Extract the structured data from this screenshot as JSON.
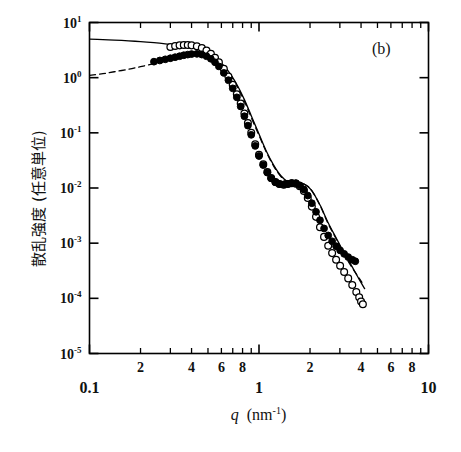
{
  "figure": {
    "panel_label": "(b)",
    "caption_fragment": ""
  },
  "chart_data": {
    "type": "scatter",
    "title": "",
    "xlabel": "q (nm-1)",
    "xlabel_symbol": "q",
    "xlabel_unit": "nm",
    "xlabel_unit_exp": "-1",
    "ylabel": "散乱強度 (任意単位)",
    "xscale": "log",
    "yscale": "log",
    "xlim": [
      0.1,
      10
    ],
    "ylim": [
      1e-05,
      10
    ],
    "grid": false,
    "legend": "none",
    "x_major_labels": [
      "0.1",
      "1",
      "10"
    ],
    "x_minor_labels": [
      "2",
      "4",
      "6",
      "8"
    ],
    "y_tick_labels": [
      "10^1",
      "10^0",
      "10^-1",
      "10^-2",
      "10^-3",
      "10^-4",
      "10^-5"
    ],
    "y_tick_mantissa": [
      "10",
      "10",
      "10",
      "10",
      "10",
      "10",
      "10"
    ],
    "y_tick_exponents": [
      "1",
      "0",
      "-1",
      "-2",
      "-3",
      "-4",
      "-5"
    ],
    "y_tick_values": [
      10,
      1,
      0.1,
      0.01,
      0.001,
      0.0001,
      1e-05
    ],
    "series": [
      {
        "name": "open-circles",
        "marker": "open-circle",
        "color": "#000000",
        "x": [
          0.3,
          0.32,
          0.34,
          0.36,
          0.38,
          0.4,
          0.43,
          0.46,
          0.49,
          0.52,
          0.55,
          0.58,
          0.62,
          0.66,
          0.7,
          0.74,
          0.78,
          0.82,
          0.86,
          0.9,
          0.95,
          1.0,
          1.06,
          1.12,
          1.18,
          1.25,
          1.32,
          1.4,
          1.48,
          1.56,
          1.65,
          1.74,
          1.84,
          1.94,
          2.05,
          2.17,
          2.29,
          2.42,
          2.56,
          2.7,
          2.85,
          3.01,
          3.18,
          3.36,
          3.55,
          3.75,
          3.9,
          4.0,
          4.1
        ],
        "y": [
          3.6,
          3.75,
          3.85,
          3.9,
          3.9,
          3.85,
          3.7,
          3.45,
          3.1,
          2.7,
          2.3,
          1.9,
          1.45,
          1.05,
          0.74,
          0.5,
          0.34,
          0.225,
          0.15,
          0.1,
          0.062,
          0.04,
          0.027,
          0.0195,
          0.0152,
          0.0128,
          0.0118,
          0.0115,
          0.0118,
          0.0122,
          0.012,
          0.0108,
          0.0088,
          0.0066,
          0.0046,
          0.003,
          0.00195,
          0.0013,
          0.0009,
          0.00066,
          0.0005,
          0.00039,
          0.0003,
          0.00023,
          0.000175,
          0.00013,
          0.000105,
          8.8e-05,
          7.8e-05
        ]
      },
      {
        "name": "filled-circles",
        "marker": "filled-circle",
        "color": "#000000",
        "x": [
          0.24,
          0.26,
          0.28,
          0.3,
          0.32,
          0.34,
          0.36,
          0.38,
          0.4,
          0.43,
          0.46,
          0.49,
          0.52,
          0.55,
          0.58,
          0.62,
          0.66,
          0.7,
          0.74,
          0.78,
          0.82,
          0.86,
          0.9,
          0.95,
          1.0,
          1.06,
          1.12,
          1.18,
          1.25,
          1.32,
          1.4,
          1.48,
          1.56,
          1.65,
          1.74,
          1.84,
          1.94,
          2.05,
          2.17,
          2.29,
          2.42,
          2.56,
          2.7,
          2.85,
          3.01,
          3.18,
          3.36,
          3.55,
          3.7
        ],
        "y": [
          1.95,
          2.05,
          2.15,
          2.25,
          2.35,
          2.45,
          2.55,
          2.62,
          2.68,
          2.7,
          2.62,
          2.45,
          2.2,
          1.9,
          1.6,
          1.22,
          0.9,
          0.64,
          0.44,
          0.3,
          0.2,
          0.135,
          0.092,
          0.058,
          0.038,
          0.026,
          0.019,
          0.015,
          0.0127,
          0.0118,
          0.0116,
          0.0119,
          0.0123,
          0.0122,
          0.0112,
          0.0094,
          0.0073,
          0.0053,
          0.0037,
          0.0026,
          0.00185,
          0.00138,
          0.00108,
          0.00088,
          0.00074,
          0.00064,
          0.00056,
          0.0005,
          0.00047
        ]
      }
    ],
    "lines": [
      {
        "name": "solid-model-line",
        "style": "solid",
        "color": "#000000",
        "x": [
          0.1,
          0.12,
          0.14,
          0.17,
          0.2,
          0.24,
          0.28,
          0.32,
          0.36,
          0.4,
          0.45,
          0.5,
          0.56,
          0.62,
          0.68,
          0.75,
          0.82,
          0.9,
          1.0,
          1.1,
          1.22,
          1.35,
          1.5,
          1.65,
          1.85,
          2.05,
          2.3,
          2.55,
          2.85,
          3.15,
          3.5,
          3.9,
          4.2
        ],
        "y": [
          5.0,
          4.9,
          4.8,
          4.65,
          4.5,
          4.3,
          4.1,
          3.9,
          3.8,
          3.65,
          3.3,
          2.85,
          2.25,
          1.65,
          1.15,
          0.7,
          0.4,
          0.205,
          0.095,
          0.048,
          0.026,
          0.0165,
          0.0125,
          0.012,
          0.0118,
          0.009,
          0.0048,
          0.0024,
          0.00125,
          0.0007,
          0.0004,
          0.00022,
          0.00015
        ]
      },
      {
        "name": "dashed-model-line",
        "style": "dashed",
        "color": "#000000",
        "x": [
          0.1,
          0.12,
          0.14,
          0.17,
          0.2,
          0.24,
          0.28,
          0.32,
          0.36,
          0.4,
          0.45,
          0.5,
          0.56,
          0.62,
          0.68,
          0.75,
          0.82,
          0.9,
          1.0,
          1.1,
          1.22,
          1.35,
          1.5,
          1.65,
          1.85,
          2.05,
          2.3,
          2.55,
          2.85,
          3.15,
          3.5,
          3.8,
          4.05
        ],
        "y": [
          1.1,
          1.18,
          1.28,
          1.42,
          1.58,
          1.8,
          2.02,
          2.25,
          2.45,
          2.62,
          2.7,
          2.55,
          2.15,
          1.62,
          1.12,
          0.66,
          0.375,
          0.19,
          0.09,
          0.046,
          0.025,
          0.016,
          0.0124,
          0.012,
          0.0117,
          0.0089,
          0.0047,
          0.0023,
          0.0012,
          0.00066,
          0.00038,
          0.00026,
          0.000195
        ]
      }
    ]
  }
}
